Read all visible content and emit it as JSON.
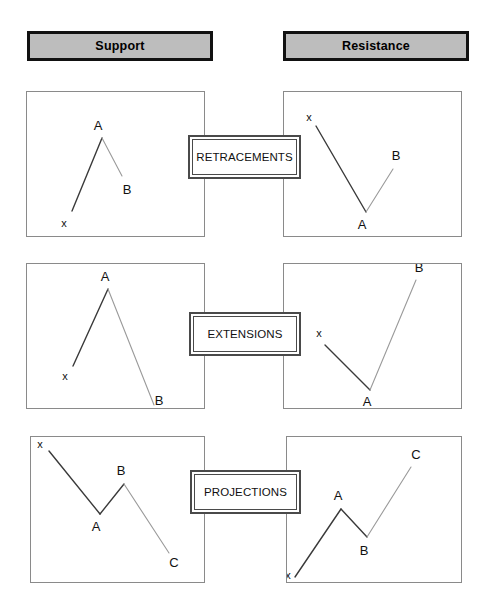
{
  "headers": {
    "support": "Support",
    "resistance": "Resistance"
  },
  "center_labels": {
    "row1": "RETRACEMENTS",
    "row2": "EXTENSIONS",
    "row3": "PROJECTIONS"
  },
  "colors": {
    "header_fill": "#bdbdbd",
    "header_border": "#111111",
    "panel_border": "#8a8a8a",
    "line_primary": "#3a3a3a",
    "line_secondary": "#9a9a9a",
    "label_text": "#111111",
    "background": "#ffffff"
  },
  "chart_data": [
    {
      "id": "support-retracements",
      "type": "line",
      "title": "Support",
      "annotation": "RETRACEMENTS",
      "column": "Support",
      "row": "RETRACEMENTS",
      "panel": {
        "x": 26,
        "y": 91,
        "width": 179,
        "height": 146
      },
      "points": [
        {
          "label": "x",
          "x": 71,
          "y": 210,
          "label_dx": -8,
          "label_dy": 16
        },
        {
          "label": "A",
          "x": 101,
          "y": 137,
          "label_dx": -4,
          "label_dy": -8
        },
        {
          "label": "B",
          "x": 121,
          "y": 175,
          "label_dx": 5,
          "label_dy": 18
        }
      ],
      "segments": [
        {
          "from": "x",
          "to": "A",
          "tone": "primary"
        },
        {
          "from": "A",
          "to": "B",
          "tone": "secondary"
        }
      ]
    },
    {
      "id": "resistance-retracements",
      "type": "line",
      "title": "Resistance",
      "annotation": "RETRACEMENTS",
      "column": "Resistance",
      "row": "RETRACEMENTS",
      "panel": {
        "x": 283,
        "y": 91,
        "width": 179,
        "height": 146
      },
      "points": [
        {
          "label": "x",
          "x": 315,
          "y": 125,
          "label_dx": -7,
          "label_dy": -5
        },
        {
          "label": "A",
          "x": 365,
          "y": 211,
          "label_dx": -4,
          "label_dy": 17
        },
        {
          "label": "B",
          "x": 392,
          "y": 168,
          "label_dx": 3,
          "label_dy": -9
        }
      ],
      "segments": [
        {
          "from": "x",
          "to": "A",
          "tone": "primary"
        },
        {
          "from": "A",
          "to": "B",
          "tone": "secondary"
        }
      ]
    },
    {
      "id": "support-extensions",
      "type": "line",
      "title": "Support",
      "annotation": "EXTENSIONS",
      "column": "Support",
      "row": "EXTENSIONS",
      "panel": {
        "x": 26,
        "y": 263,
        "width": 179,
        "height": 146
      },
      "points": [
        {
          "label": "x",
          "x": 72,
          "y": 365,
          "label_dx": -8,
          "label_dy": 14
        },
        {
          "label": "A",
          "x": 107,
          "y": 288,
          "label_dx": -3,
          "label_dy": -8
        },
        {
          "label": "B",
          "x": 153,
          "y": 404,
          "label_dx": 5,
          "label_dy": 0
        }
      ],
      "segments": [
        {
          "from": "x",
          "to": "A",
          "tone": "primary"
        },
        {
          "from": "A",
          "to": "B",
          "tone": "secondary"
        }
      ]
    },
    {
      "id": "resistance-extensions",
      "type": "line",
      "title": "Resistance",
      "annotation": "EXTENSIONS",
      "column": "Resistance",
      "row": "EXTENSIONS",
      "panel": {
        "x": 283,
        "y": 263,
        "width": 179,
        "height": 146
      },
      "points": [
        {
          "label": "x",
          "x": 324,
          "y": 344,
          "label_dx": -6,
          "label_dy": -8
        },
        {
          "label": "A",
          "x": 369,
          "y": 389,
          "label_dx": -3,
          "label_dy": 16
        },
        {
          "label": "B",
          "x": 415,
          "y": 279,
          "label_dx": 3,
          "label_dy": -8
        }
      ],
      "segments": [
        {
          "from": "x",
          "to": "A",
          "tone": "primary"
        },
        {
          "from": "A",
          "to": "B",
          "tone": "secondary"
        }
      ]
    },
    {
      "id": "support-projections",
      "type": "line",
      "title": "Support",
      "annotation": "PROJECTIONS",
      "column": "Support",
      "row": "PROJECTIONS",
      "panel": {
        "x": 30,
        "y": 436,
        "width": 175,
        "height": 147
      },
      "points": [
        {
          "label": "x",
          "x": 48,
          "y": 450,
          "label_dx": -9,
          "label_dy": -3
        },
        {
          "label": "A",
          "x": 99,
          "y": 513,
          "label_dx": -4,
          "label_dy": 17
        },
        {
          "label": "B",
          "x": 123,
          "y": 483,
          "label_dx": -3,
          "label_dy": -9
        },
        {
          "label": "C",
          "x": 168,
          "y": 552,
          "label_dx": 5,
          "label_dy": 14
        }
      ],
      "segments": [
        {
          "from": "x",
          "to": "A",
          "tone": "primary"
        },
        {
          "from": "A",
          "to": "B",
          "tone": "primary"
        },
        {
          "from": "B",
          "to": "C",
          "tone": "secondary"
        }
      ]
    },
    {
      "id": "resistance-projections",
      "type": "line",
      "title": "Resistance",
      "annotation": "PROJECTIONS",
      "column": "Resistance",
      "row": "PROJECTIONS",
      "panel": {
        "x": 286,
        "y": 436,
        "width": 176,
        "height": 147
      },
      "points": [
        {
          "label": "x",
          "x": 294,
          "y": 576,
          "label_dx": -7,
          "label_dy": 2
        },
        {
          "label": "A",
          "x": 340,
          "y": 508,
          "label_dx": -3,
          "label_dy": -9
        },
        {
          "label": "B",
          "x": 366,
          "y": 536,
          "label_dx": -3,
          "label_dy": 18
        },
        {
          "label": "C",
          "x": 410,
          "y": 466,
          "label_dx": 5,
          "label_dy": -8
        }
      ],
      "segments": [
        {
          "from": "x",
          "to": "A",
          "tone": "primary"
        },
        {
          "from": "A",
          "to": "B",
          "tone": "primary"
        },
        {
          "from": "B",
          "to": "C",
          "tone": "secondary"
        }
      ]
    }
  ]
}
